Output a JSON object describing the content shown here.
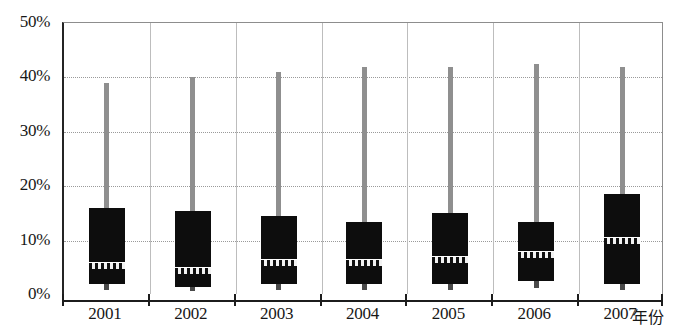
{
  "chart_data": {
    "type": "box",
    "title": "",
    "xlabel": "年份",
    "ylabel": "",
    "ylim": [
      0,
      50
    ],
    "y_ticks": [
      0,
      10,
      20,
      30,
      40,
      50
    ],
    "y_tick_labels": [
      "0%",
      "10%",
      "20%",
      "30%",
      "40%",
      "50%"
    ],
    "grid": true,
    "legend": "none",
    "categories": [
      "2001",
      "2002",
      "2003",
      "2004",
      "2005",
      "2006",
      "2007"
    ],
    "boxes": [
      {
        "category": "2001",
        "whisker_high": 39.0,
        "box_top": 16.0,
        "median": 5.5,
        "box_bottom": 2.0,
        "whisker_low": 1.0
      },
      {
        "category": "2002",
        "whisker_high": 40.0,
        "box_top": 15.5,
        "median": 4.5,
        "box_bottom": 1.5,
        "whisker_low": 0.8
      },
      {
        "category": "2003",
        "whisker_high": 41.0,
        "box_top": 14.5,
        "median": 6.0,
        "box_bottom": 2.0,
        "whisker_low": 1.0
      },
      {
        "category": "2004",
        "whisker_high": 42.0,
        "box_top": 13.5,
        "median": 6.0,
        "box_bottom": 2.0,
        "whisker_low": 1.0
      },
      {
        "category": "2005",
        "whisker_high": 42.0,
        "box_top": 15.0,
        "median": 6.5,
        "box_bottom": 2.0,
        "whisker_low": 1.0
      },
      {
        "category": "2006",
        "whisker_high": 42.5,
        "box_top": 13.5,
        "median": 7.5,
        "box_bottom": 2.5,
        "whisker_low": 1.2
      },
      {
        "category": "2007",
        "whisker_high": 42.0,
        "box_top": 18.5,
        "median": 10.0,
        "box_bottom": 2.0,
        "whisker_low": 1.0
      }
    ],
    "colors": {
      "box_fill": "#0d0d0d",
      "whisker": "#8f8f8f",
      "median_band": "#101010",
      "gridline": "#9a9a9a",
      "axis": "#1c1c1c",
      "background": "#ffffff"
    }
  },
  "axis": {
    "y_labels": [
      "50%",
      "40%",
      "30%",
      "20%",
      "10%",
      "0%"
    ],
    "x_labels": [
      "2001",
      "2002",
      "2003",
      "2004",
      "2005",
      "2006",
      "2007"
    ],
    "x_title": "年份"
  }
}
